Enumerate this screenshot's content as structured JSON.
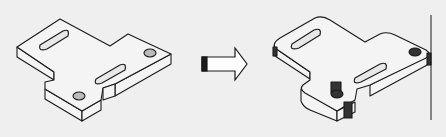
{
  "figure": {
    "panels": [
      {
        "id": "before",
        "label": "",
        "state": "sharp-edged plate with two slots and two holes"
      },
      {
        "id": "arrow",
        "label": "",
        "meaning": "transforms-to"
      },
      {
        "id": "after",
        "label": "",
        "state": "plate with rounded/filleted edges"
      }
    ],
    "colors": {
      "background": "#efefef",
      "ink": "#1a1a1a",
      "face": "#f4f4f4",
      "shade": "#2a2a2a"
    }
  }
}
